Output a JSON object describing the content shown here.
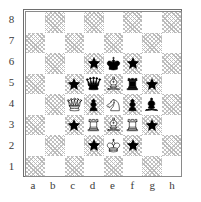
{
  "diagram": {
    "type": "chess-board",
    "orientation": "white-bottom",
    "rank_labels": [
      "8",
      "7",
      "6",
      "5",
      "4",
      "3",
      "2",
      "1"
    ],
    "file_labels": [
      "a",
      "b",
      "c",
      "d",
      "e",
      "f",
      "g",
      "h"
    ],
    "colors": {
      "light_square": "#ffffff",
      "dark_square": "#bdbdbd",
      "border": "#6e6e6e",
      "piece_black": "#000000",
      "piece_white_outline": "#000000",
      "marker": "#000000",
      "label_text": "#3a3a3a"
    },
    "marker_glyph": "star",
    "squares": [
      {
        "id": "a8",
        "file": "a",
        "rank": 8,
        "shade": "light",
        "content": null
      },
      {
        "id": "b8",
        "file": "b",
        "rank": 8,
        "shade": "dark",
        "content": null
      },
      {
        "id": "c8",
        "file": "c",
        "rank": 8,
        "shade": "light",
        "content": null
      },
      {
        "id": "d8",
        "file": "d",
        "rank": 8,
        "shade": "dark",
        "content": null
      },
      {
        "id": "e8",
        "file": "e",
        "rank": 8,
        "shade": "light",
        "content": null
      },
      {
        "id": "f8",
        "file": "f",
        "rank": 8,
        "shade": "dark",
        "content": null
      },
      {
        "id": "g8",
        "file": "g",
        "rank": 8,
        "shade": "light",
        "content": null
      },
      {
        "id": "h8",
        "file": "h",
        "rank": 8,
        "shade": "dark",
        "content": null
      },
      {
        "id": "a7",
        "file": "a",
        "rank": 7,
        "shade": "dark",
        "content": null
      },
      {
        "id": "b7",
        "file": "b",
        "rank": 7,
        "shade": "light",
        "content": null
      },
      {
        "id": "c7",
        "file": "c",
        "rank": 7,
        "shade": "dark",
        "content": null
      },
      {
        "id": "d7",
        "file": "d",
        "rank": 7,
        "shade": "light",
        "content": null
      },
      {
        "id": "e7",
        "file": "e",
        "rank": 7,
        "shade": "dark",
        "content": null
      },
      {
        "id": "f7",
        "file": "f",
        "rank": 7,
        "shade": "light",
        "content": null
      },
      {
        "id": "g7",
        "file": "g",
        "rank": 7,
        "shade": "dark",
        "content": null
      },
      {
        "id": "h7",
        "file": "h",
        "rank": 7,
        "shade": "light",
        "content": null
      },
      {
        "id": "a6",
        "file": "a",
        "rank": 6,
        "shade": "light",
        "content": null
      },
      {
        "id": "b6",
        "file": "b",
        "rank": 6,
        "shade": "dark",
        "content": null
      },
      {
        "id": "c6",
        "file": "c",
        "rank": 6,
        "shade": "light",
        "content": null
      },
      {
        "id": "d6",
        "file": "d",
        "rank": 6,
        "shade": "dark",
        "content": "marker"
      },
      {
        "id": "e6",
        "file": "e",
        "rank": 6,
        "shade": "light",
        "content": "black-king"
      },
      {
        "id": "f6",
        "file": "f",
        "rank": 6,
        "shade": "dark",
        "content": "marker"
      },
      {
        "id": "g6",
        "file": "g",
        "rank": 6,
        "shade": "light",
        "content": null
      },
      {
        "id": "h6",
        "file": "h",
        "rank": 6,
        "shade": "dark",
        "content": null
      },
      {
        "id": "a5",
        "file": "a",
        "rank": 5,
        "shade": "dark",
        "content": null
      },
      {
        "id": "b5",
        "file": "b",
        "rank": 5,
        "shade": "light",
        "content": null
      },
      {
        "id": "c5",
        "file": "c",
        "rank": 5,
        "shade": "dark",
        "content": "marker"
      },
      {
        "id": "d5",
        "file": "d",
        "rank": 5,
        "shade": "light",
        "content": "black-queen"
      },
      {
        "id": "e5",
        "file": "e",
        "rank": 5,
        "shade": "dark",
        "content": "white-bishop"
      },
      {
        "id": "f5",
        "file": "f",
        "rank": 5,
        "shade": "light",
        "content": "black-rook"
      },
      {
        "id": "g5",
        "file": "g",
        "rank": 5,
        "shade": "dark",
        "content": "marker"
      },
      {
        "id": "h5",
        "file": "h",
        "rank": 5,
        "shade": "light",
        "content": null
      },
      {
        "id": "a4",
        "file": "a",
        "rank": 4,
        "shade": "light",
        "content": null
      },
      {
        "id": "b4",
        "file": "b",
        "rank": 4,
        "shade": "dark",
        "content": null
      },
      {
        "id": "c4",
        "file": "c",
        "rank": 4,
        "shade": "light",
        "content": "white-queen"
      },
      {
        "id": "d4",
        "file": "d",
        "rank": 4,
        "shade": "dark",
        "content": "black-pawn"
      },
      {
        "id": "e4",
        "file": "e",
        "rank": 4,
        "shade": "light",
        "content": "white-knight"
      },
      {
        "id": "f4",
        "file": "f",
        "rank": 4,
        "shade": "dark",
        "content": "black-pawn"
      },
      {
        "id": "g4",
        "file": "g",
        "rank": 4,
        "shade": "light",
        "content": "black-bishop"
      },
      {
        "id": "h4",
        "file": "h",
        "rank": 4,
        "shade": "dark",
        "content": null
      },
      {
        "id": "a3",
        "file": "a",
        "rank": 3,
        "shade": "dark",
        "content": null
      },
      {
        "id": "b3",
        "file": "b",
        "rank": 3,
        "shade": "light",
        "content": null
      },
      {
        "id": "c3",
        "file": "c",
        "rank": 3,
        "shade": "dark",
        "content": "marker"
      },
      {
        "id": "d3",
        "file": "d",
        "rank": 3,
        "shade": "light",
        "content": "white-rook"
      },
      {
        "id": "e3",
        "file": "e",
        "rank": 3,
        "shade": "dark",
        "content": "white-bishop"
      },
      {
        "id": "f3",
        "file": "f",
        "rank": 3,
        "shade": "light",
        "content": "white-rook"
      },
      {
        "id": "g3",
        "file": "g",
        "rank": 3,
        "shade": "dark",
        "content": "marker"
      },
      {
        "id": "h3",
        "file": "h",
        "rank": 3,
        "shade": "light",
        "content": null
      },
      {
        "id": "a2",
        "file": "a",
        "rank": 2,
        "shade": "light",
        "content": null
      },
      {
        "id": "b2",
        "file": "b",
        "rank": 2,
        "shade": "dark",
        "content": null
      },
      {
        "id": "c2",
        "file": "c",
        "rank": 2,
        "shade": "light",
        "content": null
      },
      {
        "id": "d2",
        "file": "d",
        "rank": 2,
        "shade": "dark",
        "content": "marker"
      },
      {
        "id": "e2",
        "file": "e",
        "rank": 2,
        "shade": "light",
        "content": "white-king"
      },
      {
        "id": "f2",
        "file": "f",
        "rank": 2,
        "shade": "dark",
        "content": "marker"
      },
      {
        "id": "g2",
        "file": "g",
        "rank": 2,
        "shade": "light",
        "content": null
      },
      {
        "id": "h2",
        "file": "h",
        "rank": 2,
        "shade": "dark",
        "content": null
      },
      {
        "id": "a1",
        "file": "a",
        "rank": 1,
        "shade": "dark",
        "content": null
      },
      {
        "id": "b1",
        "file": "b",
        "rank": 1,
        "shade": "light",
        "content": null
      },
      {
        "id": "c1",
        "file": "c",
        "rank": 1,
        "shade": "dark",
        "content": null
      },
      {
        "id": "d1",
        "file": "d",
        "rank": 1,
        "shade": "light",
        "content": null
      },
      {
        "id": "e1",
        "file": "e",
        "rank": 1,
        "shade": "dark",
        "content": null
      },
      {
        "id": "f1",
        "file": "f",
        "rank": 1,
        "shade": "light",
        "content": null
      },
      {
        "id": "g1",
        "file": "g",
        "rank": 1,
        "shade": "dark",
        "content": null
      },
      {
        "id": "h1",
        "file": "h",
        "rank": 1,
        "shade": "light",
        "content": null
      }
    ]
  }
}
